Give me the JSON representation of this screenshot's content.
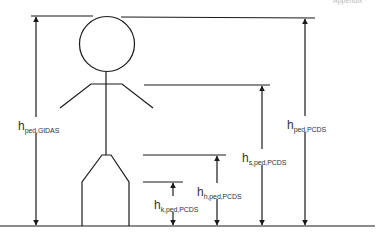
{
  "header": {
    "clipped_text": "Appendix"
  },
  "diagram": {
    "colors": {
      "line": "#1a1a1a",
      "text": "#333333",
      "background": "#ffffff"
    },
    "labels": {
      "ped_gidas": {
        "base": "h",
        "sub": "ped,GIDAS"
      },
      "k_ped_pcds": {
        "base": "h",
        "sub": "k,ped,PCDS"
      },
      "h_ped_pcds": {
        "base": "h",
        "sub": "h,ped,PCDS"
      },
      "s_ped_pcds": {
        "base": "h",
        "sub": "s,ped,PCDS"
      },
      "ped_pcds": {
        "base": "h",
        "sub": "ped,PCDS"
      }
    },
    "reference_levels": [
      {
        "name": "head-top-gidas",
        "y": 16
      },
      {
        "name": "head-top-pcds",
        "y": 18
      },
      {
        "name": "shoulder",
        "y": 85
      },
      {
        "name": "hip",
        "y": 155
      },
      {
        "name": "knee",
        "y": 182
      },
      {
        "name": "ground",
        "y": 226
      }
    ]
  }
}
